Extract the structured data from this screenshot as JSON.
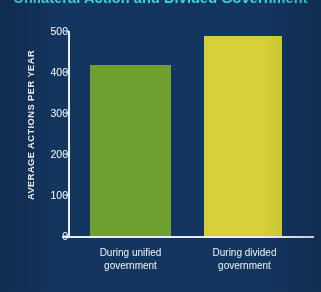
{
  "chart_data": {
    "type": "bar",
    "title": "Unilateral Action and Divided Government",
    "xlabel": "",
    "ylabel": "AVERAGE ACTIONS PER YEAR",
    "categories": [
      "During unified government",
      "During divided government"
    ],
    "category_lines": [
      [
        "During unified",
        "government"
      ],
      [
        "During divided",
        "government"
      ]
    ],
    "values": [
      418,
      487
    ],
    "series": [
      {
        "name": "Average actions per year",
        "values": [
          418,
          487
        ]
      }
    ],
    "ylim": [
      0,
      500
    ],
    "yticks": [
      0,
      100,
      200,
      300,
      400,
      500
    ],
    "ytick_labels": [
      "0",
      "100",
      "200",
      "300",
      "400",
      "500"
    ],
    "grid": false,
    "legend": false,
    "bar_colors": [
      "#6fa02f",
      "#d6d038"
    ],
    "background_color": "#13355f",
    "title_color": "#35d6d6",
    "axis_color": "#e8eef4",
    "text_color": "#ffffff"
  }
}
